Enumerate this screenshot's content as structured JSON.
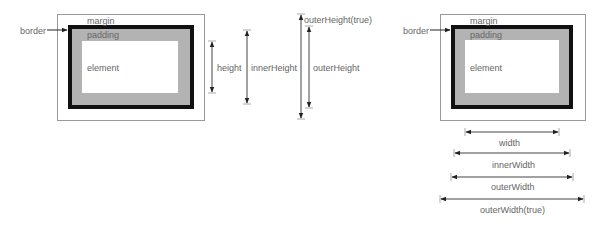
{
  "diagram": {
    "left_box": {
      "margin_label": "margin",
      "padding_label": "padding",
      "element_label": "element",
      "border_label": "border"
    },
    "right_box": {
      "margin_label": "margin",
      "padding_label": "padding",
      "element_label": "element",
      "border_label": "border"
    },
    "height_measures": [
      {
        "label": "height"
      },
      {
        "label": "innerHeight"
      },
      {
        "label": "outerHeight"
      },
      {
        "label": "outerHeight(true)"
      }
    ],
    "width_measures": [
      {
        "label": "width"
      },
      {
        "label": "innerWidth"
      },
      {
        "label": "outerWidth"
      },
      {
        "label": "outerWidth(true)"
      }
    ],
    "colors": {
      "border": "#111111",
      "padding": "#b3b3b3",
      "margin_outline": "#999999",
      "arrow": "#222222"
    }
  }
}
